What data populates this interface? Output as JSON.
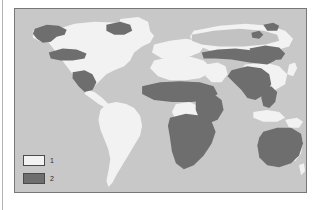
{
  "figure": {
    "kind": "world-distribution-map",
    "background_color": "#ffffff"
  },
  "map": {
    "frame_border_color": "#787878",
    "ocean_color": "#c8c8c8",
    "land_class_1_color": "#f2f2f2",
    "land_class_2_color": "#6e6e6e",
    "land_class_3_color": "#c2c2c2"
  },
  "legend": {
    "items": [
      {
        "label": "1",
        "swatch_fill": "#f2f2f2",
        "swatch_border": "#4a4a4a"
      },
      {
        "label": "2",
        "swatch_fill": "#6e6e6e",
        "swatch_border": "#4a4a4a"
      }
    ]
  },
  "regions": {
    "class_1_land": [
      "North America",
      "Greenland",
      "South America",
      "North Africa",
      "Congo Basin",
      "Europe",
      "Arabia",
      "Siberia",
      "East Asia",
      "Southeast Australia coast"
    ],
    "class_2_land": [
      "Alaska and Northwest Canada",
      "Baffin and Northeast Canada",
      "United States Southwest",
      "Mexico and Central America",
      "Sahel belt",
      "Sub-Saharan Africa",
      "Southern Africa",
      "Caucasus and Central Asia belt",
      "Mongolia and Northern China",
      "Indian Subcontinent",
      "Mainland Southeast Asia",
      "Australia"
    ],
    "class_3_land": [
      "Northern Siberia taiga belt"
    ]
  }
}
